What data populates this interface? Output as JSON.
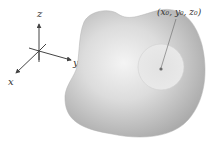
{
  "diagram": {
    "axes": {
      "labels": {
        "x": "x",
        "y": "y",
        "z": "z"
      }
    },
    "region": {
      "description": "solid region",
      "fill_color": "#b9b9b9",
      "highlight_color": "#f2f2f2"
    },
    "neighborhood": {
      "fill_color": "#e4e4e4"
    },
    "point": {
      "label": "(x₀, y₀, z₀)"
    },
    "colors": {
      "axis_stroke": "#444444",
      "text": "#333333"
    }
  }
}
